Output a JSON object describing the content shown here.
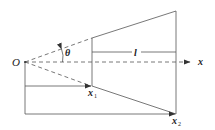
{
  "diagram": {
    "colors": {
      "line": "#555555",
      "text": "#222222",
      "background": "#ffffff"
    },
    "labels": {
      "origin": "O",
      "angle": "θ",
      "length": "l",
      "axis": "x",
      "point1_main": "x",
      "point1_sub": "1",
      "point2_main": "x",
      "point2_sub": "2"
    }
  }
}
